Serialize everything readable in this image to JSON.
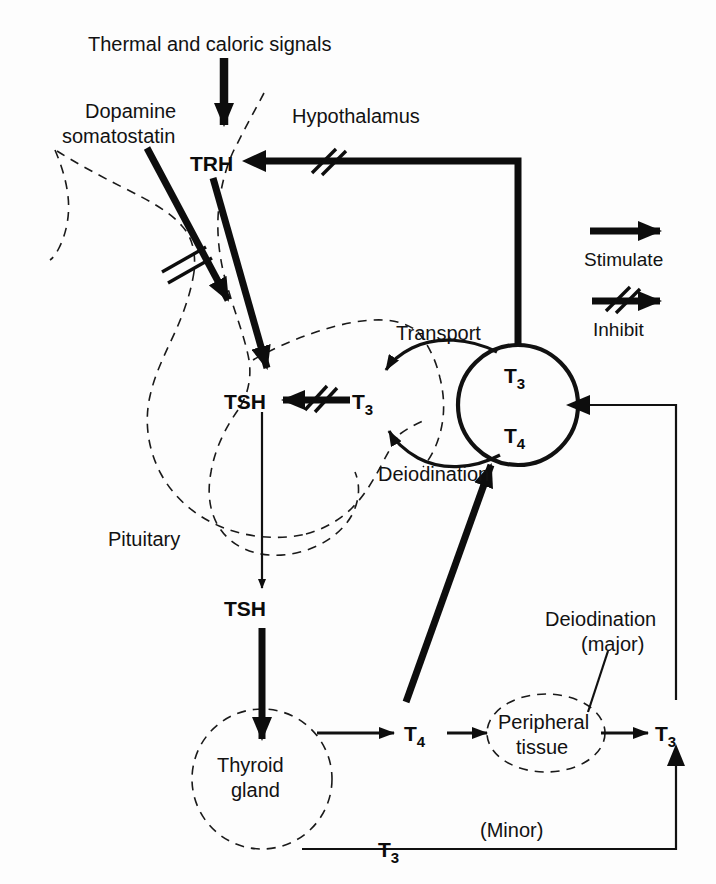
{
  "figure": {
    "background_color": "#fdfdfd",
    "ink_color": "#111111"
  },
  "labels": {
    "thermal": "Thermal and caloric signals",
    "dopamine": "Dopamine",
    "somatostatin": "somatostatin",
    "hypothalamus": "Hypothalamus",
    "pituitary": "Pituitary",
    "trh": "TRH",
    "tsh_pituitary": "TSH",
    "tsh_secreted": "TSH",
    "t3_pituitary_base": "T",
    "t3_pituitary_sub": "3",
    "t3_pool_base": "T",
    "t3_pool_sub": "3",
    "t4_pool_base": "T",
    "t4_pool_sub": "4",
    "transport": "Transport",
    "deiodination_pool": "Deiodination",
    "thyroid_gland_line1": "Thyroid",
    "thyroid_gland_line2": "gland",
    "t4_secreted_base": "T",
    "t4_secreted_sub": "4",
    "peripheral_line1": "Peripheral",
    "peripheral_line2": "tissue",
    "deiodination_major_line1": "Deiodination",
    "deiodination_major_line2": "(major)",
    "t3_peripheral_base": "T",
    "t3_peripheral_sub": "3",
    "t3_thyroid_base": "T",
    "t3_thyroid_sub": "3",
    "minor": "(Minor)"
  },
  "legend": {
    "stimulate": "Stimulate",
    "inhibit": "Inhibit"
  }
}
